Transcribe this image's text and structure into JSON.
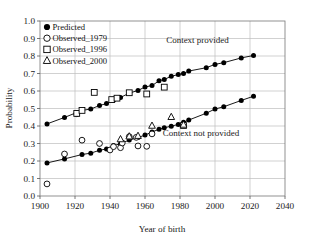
{
  "chart_data": {
    "type": "scatter",
    "title": "",
    "xlabel": "Year of birth",
    "ylabel": "Probability",
    "xlim": [
      1900,
      2040
    ],
    "ylim": [
      0.0,
      1.0
    ],
    "xticks": [
      1900,
      1920,
      1940,
      1960,
      1980,
      2000,
      2020,
      2040
    ],
    "xtick_labels": [
      "1900",
      "1920",
      "1940",
      "1960",
      "1980",
      "2000",
      "2020",
      "2040"
    ],
    "yticks": [
      0.0,
      0.1,
      0.2,
      0.3,
      0.4,
      0.5,
      0.6,
      0.7,
      0.8,
      0.9,
      1.0
    ],
    "ytick_labels": [
      "0.0",
      "0.1",
      "0.2",
      "0.3",
      "0.4",
      "0.5",
      "0.6",
      "0.7",
      "0.8",
      "0.9",
      "1.0"
    ],
    "grid": true,
    "legend_position": "top-left",
    "legend": [
      {
        "name": "Predicted",
        "marker": "filled-circle"
      },
      {
        "name": "Observed_1979",
        "marker": "open-circle"
      },
      {
        "name": "Observed_1996",
        "marker": "open-square"
      },
      {
        "name": "Observed_2000",
        "marker": "open-triangle"
      }
    ],
    "annotations": [
      {
        "text": "Context provided",
        "x": 1990,
        "y": 0.875
      },
      {
        "text": "Context not provided",
        "x": 1992,
        "y": 0.345
      }
    ],
    "series": [
      {
        "name": "Predicted_context_provided",
        "marker": "filled-circle",
        "line": true,
        "points": [
          [
            1904,
            0.412
          ],
          [
            1914,
            0.449
          ],
          [
            1924,
            0.489
          ],
          [
            1929,
            0.497
          ],
          [
            1934,
            0.517
          ],
          [
            1938,
            0.528
          ],
          [
            1942,
            0.549
          ],
          [
            1946,
            0.563
          ],
          [
            1951,
            0.588
          ],
          [
            1956,
            0.603
          ],
          [
            1960,
            0.623
          ],
          [
            1964,
            0.631
          ],
          [
            1968,
            0.658
          ],
          [
            1971,
            0.666
          ],
          [
            1975,
            0.684
          ],
          [
            1979,
            0.694
          ],
          [
            1982,
            0.7
          ],
          [
            1985,
            0.714
          ],
          [
            1995,
            0.733
          ],
          [
            2000,
            0.752
          ],
          [
            2005,
            0.762
          ],
          [
            2015,
            0.789
          ],
          [
            2022,
            0.803
          ]
        ]
      },
      {
        "name": "Predicted_context_not_provided",
        "marker": "filled-circle",
        "line": true,
        "points": [
          [
            1904,
            0.189
          ],
          [
            1914,
            0.212
          ],
          [
            1924,
            0.237
          ],
          [
            1929,
            0.245
          ],
          [
            1934,
            0.261
          ],
          [
            1938,
            0.269
          ],
          [
            1942,
            0.288
          ],
          [
            1946,
            0.299
          ],
          [
            1951,
            0.32
          ],
          [
            1956,
            0.334
          ],
          [
            1960,
            0.348
          ],
          [
            1964,
            0.366
          ],
          [
            1968,
            0.381
          ],
          [
            1971,
            0.39
          ],
          [
            1975,
            0.399
          ],
          [
            1979,
            0.409
          ],
          [
            1982,
            0.421
          ],
          [
            1985,
            0.434
          ],
          [
            1995,
            0.473
          ],
          [
            2000,
            0.497
          ],
          [
            2005,
            0.51
          ],
          [
            2015,
            0.546
          ],
          [
            2022,
            0.57
          ]
        ]
      },
      {
        "name": "Observed_1979",
        "marker": "open-circle",
        "line": false,
        "points": [
          [
            1904,
            0.069
          ],
          [
            1914,
            0.24
          ],
          [
            1924,
            0.319
          ],
          [
            1934,
            0.3
          ],
          [
            1940,
            0.263
          ],
          [
            1942,
            0.282
          ],
          [
            1946,
            0.276
          ],
          [
            1947,
            0.303
          ],
          [
            1951,
            0.339
          ],
          [
            1955,
            0.335
          ],
          [
            1956,
            0.286
          ],
          [
            1961,
            0.284
          ],
          [
            1964,
            0.355
          ],
          [
            1921,
            0.47
          ]
        ]
      },
      {
        "name": "Observed_1996",
        "marker": "open-square",
        "line": false,
        "points": [
          [
            1921,
            0.472
          ],
          [
            1924,
            0.489
          ],
          [
            1931,
            0.592
          ],
          [
            1941,
            0.551
          ],
          [
            1944,
            0.559
          ],
          [
            1951,
            0.59
          ],
          [
            1961,
            0.583
          ],
          [
            1971,
            0.622
          ],
          [
            1982,
            0.403
          ]
        ]
      },
      {
        "name": "Observed_2000",
        "marker": "open-triangle",
        "line": false,
        "points": [
          [
            1946,
            0.325
          ],
          [
            1951,
            0.341
          ],
          [
            1956,
            0.344
          ],
          [
            1964,
            0.402
          ],
          [
            1975,
            0.452
          ],
          [
            1982,
            0.408
          ]
        ]
      }
    ]
  }
}
